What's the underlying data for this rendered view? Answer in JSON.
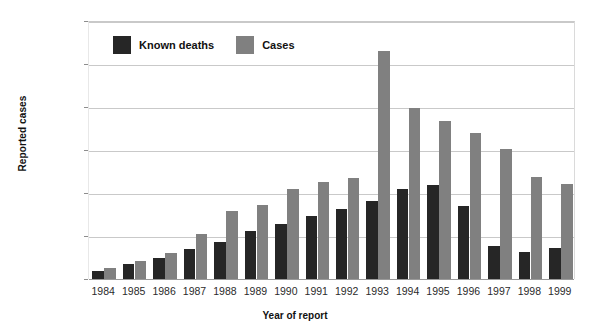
{
  "chart_data": {
    "type": "bar",
    "title": "",
    "xlabel": "Year of report",
    "ylabel": "Reported cases",
    "categories": [
      "1984",
      "1985",
      "1986",
      "1987",
      "1988",
      "1989",
      "1990",
      "1991",
      "1992",
      "1993",
      "1994",
      "1995",
      "1996",
      "1997",
      "1998",
      "1999"
    ],
    "series": [
      {
        "name": "Known deaths",
        "color": "#262626",
        "values": [
          3500,
          7000,
          10000,
          14000,
          17000,
          22500,
          25500,
          29500,
          32500,
          36500,
          42000,
          43500,
          34000,
          15500,
          12500,
          14500
        ]
      },
      {
        "name": "Cases",
        "color": "#808080",
        "values": [
          5000,
          8500,
          12000,
          21000,
          31500,
          34500,
          42000,
          45000,
          47000,
          106000,
          79500,
          73500,
          68000,
          60500,
          47500,
          44000
        ]
      }
    ],
    "ylim": [
      0,
      120000
    ],
    "ytick_values": [
      0,
      20000,
      40000,
      60000,
      80000,
      100000,
      120000
    ],
    "ytick_labels": [
      "0",
      "20,000",
      "40,000",
      "60,000",
      "80,000",
      "100,000",
      "120,000"
    ],
    "grid": true,
    "legend_position": "inside-top-left"
  },
  "legend": {
    "entries": [
      {
        "label": "Known deaths",
        "swatch_name": "legend-swatch-known-deaths"
      },
      {
        "label": "Cases",
        "swatch_name": "legend-swatch-cases"
      }
    ]
  },
  "axes": {
    "y_title": "Reported cases",
    "x_title": "Year of report"
  },
  "colors": {
    "deaths": "#262626",
    "cases": "#808080",
    "gridline": "#c9c9c9",
    "baseline": "#9a9a9a",
    "text": "#1a1a1a",
    "background": "#ffffff"
  }
}
